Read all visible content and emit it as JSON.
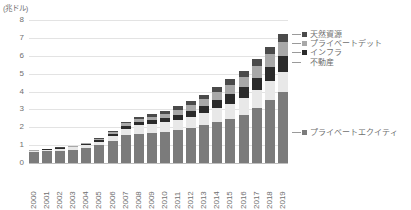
{
  "chart_data": {
    "type": "bar",
    "stacked": true,
    "title": "",
    "subtitle": "",
    "unit_label": "(兆ドル)",
    "xlabel": "",
    "ylabel": "",
    "ylim": [
      0,
      8
    ],
    "yticks": [
      8,
      7,
      6,
      5,
      4,
      3,
      2,
      1,
      0
    ],
    "grid": true,
    "legend_position": "right",
    "categories": [
      "2000",
      "2001",
      "2002",
      "2003",
      "2004",
      "2005",
      "2006",
      "2007",
      "2008",
      "2009",
      "2010",
      "2011",
      "2012",
      "2013",
      "2014",
      "2015",
      "2016",
      "2017",
      "2018",
      "2019"
    ],
    "series": [
      {
        "name": "プライベートエクイティ",
        "color": "#7b7b7b",
        "values": [
          0.6,
          0.65,
          0.7,
          0.75,
          0.85,
          1.0,
          1.25,
          1.55,
          1.65,
          1.7,
          1.75,
          1.85,
          1.95,
          2.1,
          2.3,
          2.45,
          2.7,
          3.1,
          3.55,
          4.0
        ]
      },
      {
        "name": "不動産",
        "color": "#e8e8e8",
        "values": [
          0.08,
          0.09,
          0.1,
          0.12,
          0.15,
          0.2,
          0.28,
          0.38,
          0.45,
          0.48,
          0.52,
          0.58,
          0.65,
          0.72,
          0.8,
          0.88,
          0.95,
          1.0,
          1.05,
          1.1
        ]
      },
      {
        "name": "インフラ",
        "color": "#2b2b2b",
        "values": [
          0.02,
          0.02,
          0.03,
          0.03,
          0.05,
          0.07,
          0.1,
          0.15,
          0.2,
          0.22,
          0.25,
          0.28,
          0.32,
          0.38,
          0.45,
          0.52,
          0.6,
          0.68,
          0.78,
          0.88
        ]
      },
      {
        "name": "プライベートデット",
        "color": "#a8a8a8",
        "values": [
          0.02,
          0.02,
          0.03,
          0.04,
          0.05,
          0.07,
          0.1,
          0.14,
          0.18,
          0.2,
          0.24,
          0.28,
          0.33,
          0.38,
          0.45,
          0.52,
          0.58,
          0.65,
          0.72,
          0.8
        ]
      },
      {
        "name": "天然資源",
        "color": "#4a4a4a",
        "values": [
          0.01,
          0.01,
          0.02,
          0.02,
          0.03,
          0.04,
          0.06,
          0.09,
          0.12,
          0.14,
          0.16,
          0.18,
          0.21,
          0.24,
          0.28,
          0.31,
          0.34,
          0.37,
          0.4,
          0.42
        ]
      }
    ],
    "totals": [
      0.73,
      0.79,
      0.88,
      0.96,
      1.13,
      1.38,
      1.79,
      2.31,
      2.6,
      2.74,
      2.92,
      3.17,
      3.46,
      3.82,
      4.28,
      4.68,
      5.17,
      5.8,
      6.5,
      7.2
    ]
  },
  "legend": {
    "entries": [
      {
        "label": "天然資源",
        "color": "#4a4a4a"
      },
      {
        "label": "プライベートデット",
        "color": "#a8a8a8"
      },
      {
        "label": "インフラ",
        "color": "#2b2b2b"
      },
      {
        "label": "不動産",
        "color": "#e8e8e8"
      },
      {
        "label": "プライベートエクイティ",
        "color": "#7b7b7b"
      }
    ]
  }
}
